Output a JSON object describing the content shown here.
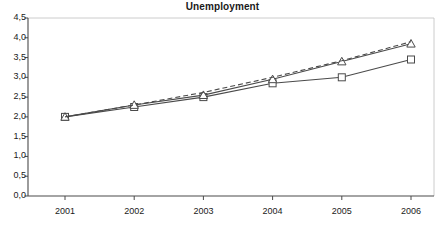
{
  "chart_data": {
    "type": "line",
    "title": "Unemployment",
    "xlabel": "",
    "ylabel": "",
    "categories": [
      "2001",
      "2002",
      "2003",
      "2004",
      "2005",
      "2006"
    ],
    "x": [
      2001,
      2002,
      2003,
      2004,
      2005,
      2006
    ],
    "ylim": [
      0.0,
      4.5
    ],
    "ytick_labels": [
      "0,0",
      "0,5",
      "1,0",
      "1,5",
      "2,0",
      "2,5",
      "3,0",
      "3,5",
      "4,0",
      "4,5"
    ],
    "ytick_values": [
      0.0,
      0.5,
      1.0,
      1.5,
      2.0,
      2.5,
      3.0,
      3.5,
      4.0,
      4.5
    ],
    "grid": false,
    "legend": "none",
    "decimal_separator": ",",
    "series": [
      {
        "name": "series-1",
        "marker": "square",
        "line_style": "solid",
        "color": "#4a4a4a",
        "values": [
          2.0,
          2.25,
          2.5,
          2.85,
          3.0,
          3.45
        ]
      },
      {
        "name": "series-2",
        "marker": "triangle",
        "line_style": "solid",
        "color": "#4a4a4a",
        "values": [
          2.0,
          2.3,
          2.55,
          2.95,
          3.4,
          3.85
        ]
      },
      {
        "name": "series-3",
        "marker": "none",
        "line_style": "dashed",
        "color": "#4a4a4a",
        "values": [
          2.0,
          2.3,
          2.62,
          3.0,
          3.42,
          3.9
        ]
      }
    ]
  },
  "axes": {
    "y_labels": [
      "4,5",
      "4,0",
      "3,5",
      "3,0",
      "2,5",
      "2,0",
      "1,5",
      "1,0",
      "0,5",
      "0,0"
    ],
    "x_labels": [
      "2001",
      "2002",
      "2003",
      "2004",
      "2005",
      "2006"
    ]
  },
  "style": {
    "axis_color": "#4a4a4a",
    "line_color": "#4a4a4a",
    "background": "#ffffff",
    "text_color": "#1a1a1a"
  }
}
